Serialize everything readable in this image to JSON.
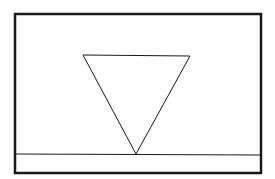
{
  "diagram": {
    "background": "#ffffff",
    "stroke_color": "#1a1a1a",
    "frame": {
      "x": 15,
      "y": 14,
      "width": 246,
      "height": 159,
      "stroke_width": 2.5
    },
    "baseline": {
      "x1": 16,
      "y1": 154,
      "x2": 260,
      "y2": 155,
      "stroke_width": 1
    },
    "triangle": {
      "points": [
        [
          83,
          55
        ],
        [
          190,
          56
        ],
        [
          136,
          154
        ]
      ],
      "orientation": "inverted",
      "stroke_width": 1
    }
  }
}
